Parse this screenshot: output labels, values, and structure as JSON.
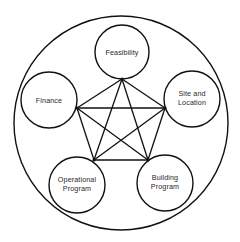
{
  "diagram": {
    "type": "complete-graph-in-circle",
    "outer_circle": {
      "cx": 121,
      "cy": 123,
      "r": 107
    },
    "nodes": [
      {
        "id": "feasibility",
        "label_lines": [
          "Feasibility"
        ],
        "cx": 122,
        "cy": 52,
        "r": 27,
        "vertex": [
          122,
          79
        ]
      },
      {
        "id": "site",
        "label_lines": [
          "Site and",
          "Location"
        ],
        "cx": 192,
        "cy": 99,
        "r": 28,
        "vertex": [
          165,
          108
        ]
      },
      {
        "id": "building",
        "label_lines": [
          "Building",
          "Program"
        ],
        "cx": 165,
        "cy": 183,
        "r": 28,
        "vertex": [
          148,
          160
        ]
      },
      {
        "id": "operational",
        "label_lines": [
          "Operational",
          "Program"
        ],
        "cx": 77,
        "cy": 185,
        "r": 28,
        "vertex": [
          94,
          160
        ]
      },
      {
        "id": "finance",
        "label_lines": [
          "Finance"
        ],
        "cx": 49,
        "cy": 100,
        "r": 28,
        "vertex": [
          77,
          108
        ]
      }
    ],
    "edges": [
      [
        "feasibility",
        "site"
      ],
      [
        "feasibility",
        "building"
      ],
      [
        "feasibility",
        "operational"
      ],
      [
        "feasibility",
        "finance"
      ],
      [
        "site",
        "building"
      ],
      [
        "site",
        "operational"
      ],
      [
        "site",
        "finance"
      ],
      [
        "building",
        "operational"
      ],
      [
        "building",
        "finance"
      ],
      [
        "operational",
        "finance"
      ]
    ]
  },
  "labels": {
    "feasibility": "Feasibility",
    "site_1": "Site and",
    "site_2": "Location",
    "finance": "Finance",
    "operational_1": "Operational",
    "operational_2": "Program",
    "building_1": "Building",
    "building_2": "Program"
  }
}
